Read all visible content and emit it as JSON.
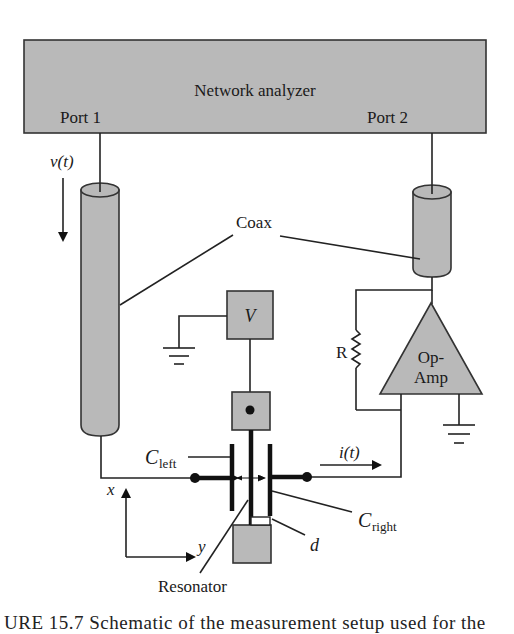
{
  "diagram": {
    "instrument": {
      "title": "Network analyzer",
      "port1": "Port 1",
      "port2": "Port 2"
    },
    "signals": {
      "voltage": "v(t)",
      "current": "i(t)"
    },
    "coax_label": "Coax",
    "bias_source": "V",
    "resistor": "R",
    "amplifier": {
      "line1": "Op-",
      "line2": "Amp"
    },
    "capacitors": {
      "left": {
        "base": "C",
        "sub": "left"
      },
      "right": {
        "base": "C",
        "sub": "right"
      }
    },
    "gap_label": "d",
    "axes": {
      "x": "x",
      "y": "y"
    },
    "resonator_label": "Resonator",
    "colors": {
      "fill": "#b9b9b9",
      "stroke": "#222222",
      "background": "#ffffff"
    }
  },
  "caption": "URE 15.7  Schematic of the measurement setup used for the"
}
